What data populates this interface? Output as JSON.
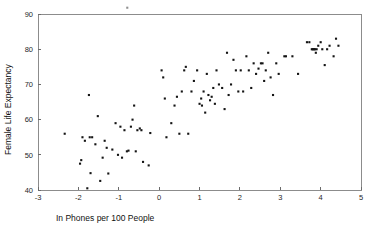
{
  "chart_data": {
    "type": "scatter",
    "title": "",
    "subtitle": "",
    "xlabel": "In Phones per 100 People",
    "ylabel": "Female Life Expectancy",
    "xlim": [
      -3,
      5
    ],
    "ylim": [
      40,
      90
    ],
    "xticks": [
      -3,
      -2,
      -1,
      0,
      1,
      2,
      3,
      4,
      5
    ],
    "xtick_labels": [
      "-3",
      "-2",
      "-1",
      "0",
      "1",
      "2",
      "3",
      "4",
      "5"
    ],
    "yticks": [
      40,
      50,
      60,
      70,
      80,
      90
    ],
    "ytick_labels": [
      "40",
      "50",
      "60",
      "70",
      "80",
      "90"
    ],
    "grid": false,
    "legend": null,
    "marker": "square-dot",
    "marker_color": "#141414",
    "frame_color": "#8c8c8c",
    "points": [
      [
        -2.34,
        56.0
      ],
      [
        -1.96,
        47.5
      ],
      [
        -1.93,
        48.5
      ],
      [
        -1.9,
        55.0
      ],
      [
        -1.84,
        54.0
      ],
      [
        -1.78,
        40.5
      ],
      [
        -1.74,
        67.0
      ],
      [
        -1.72,
        55.0
      ],
      [
        -1.7,
        44.8
      ],
      [
        -1.66,
        55.0
      ],
      [
        -1.58,
        53.0
      ],
      [
        -1.52,
        61.0
      ],
      [
        -1.46,
        42.6
      ],
      [
        -1.4,
        49.2
      ],
      [
        -1.35,
        54.0
      ],
      [
        -1.3,
        52.0
      ],
      [
        -1.26,
        44.7
      ],
      [
        -1.16,
        51.5
      ],
      [
        -1.08,
        59.0
      ],
      [
        -1.02,
        50.0
      ],
      [
        -0.96,
        58.0
      ],
      [
        -0.92,
        49.2
      ],
      [
        -0.86,
        57.0
      ],
      [
        -0.8,
        51.0
      ],
      [
        -0.76,
        51.2
      ],
      [
        -0.7,
        58.0
      ],
      [
        -0.66,
        60.0
      ],
      [
        -0.62,
        64.0
      ],
      [
        -0.58,
        51.0
      ],
      [
        -0.54,
        57.0
      ],
      [
        -0.48,
        57.5
      ],
      [
        -0.44,
        57.0
      ],
      [
        -0.4,
        48.0
      ],
      [
        -0.26,
        47.0
      ],
      [
        -0.22,
        56.2
      ],
      [
        0.06,
        74.0
      ],
      [
        0.1,
        72.0
      ],
      [
        0.14,
        66.0
      ],
      [
        0.18,
        55.0
      ],
      [
        0.3,
        59.0
      ],
      [
        0.38,
        64.0
      ],
      [
        0.44,
        66.5
      ],
      [
        0.5,
        56.0
      ],
      [
        0.56,
        68.0
      ],
      [
        0.62,
        74.0
      ],
      [
        0.66,
        75.0
      ],
      [
        0.72,
        56.0
      ],
      [
        0.8,
        68.0
      ],
      [
        0.86,
        71.0
      ],
      [
        0.94,
        74.0
      ],
      [
        1.0,
        64.5
      ],
      [
        1.04,
        66.0
      ],
      [
        1.06,
        64.0
      ],
      [
        1.1,
        68.0
      ],
      [
        1.14,
        62.0
      ],
      [
        1.18,
        73.0
      ],
      [
        1.22,
        67.0
      ],
      [
        1.26,
        65.5
      ],
      [
        1.3,
        66.5
      ],
      [
        1.34,
        69.0
      ],
      [
        1.38,
        64.5
      ],
      [
        1.42,
        74.0
      ],
      [
        1.48,
        70.0
      ],
      [
        1.56,
        69.0
      ],
      [
        1.62,
        63.0
      ],
      [
        1.68,
        79.0
      ],
      [
        1.72,
        67.0
      ],
      [
        1.78,
        70.0
      ],
      [
        1.84,
        77.0
      ],
      [
        1.9,
        74.0
      ],
      [
        1.96,
        68.0
      ],
      [
        2.02,
        74.0
      ],
      [
        2.08,
        68.0
      ],
      [
        2.16,
        78.0
      ],
      [
        2.22,
        74.0
      ],
      [
        2.28,
        69.0
      ],
      [
        2.34,
        76.0
      ],
      [
        2.4,
        73.0
      ],
      [
        2.46,
        74.5
      ],
      [
        2.52,
        76.0
      ],
      [
        2.56,
        76.0
      ],
      [
        2.6,
        71.0
      ],
      [
        2.64,
        74.0
      ],
      [
        2.7,
        79.0
      ],
      [
        2.76,
        72.0
      ],
      [
        2.82,
        67.0
      ],
      [
        2.9,
        76.0
      ],
      [
        2.96,
        73.0
      ],
      [
        3.1,
        78.0
      ],
      [
        3.14,
        78.0
      ],
      [
        3.3,
        78.0
      ],
      [
        3.44,
        73.0
      ],
      [
        3.66,
        82.0
      ],
      [
        3.72,
        82.0
      ],
      [
        3.78,
        80.0
      ],
      [
        3.8,
        80.0
      ],
      [
        3.82,
        80.0
      ],
      [
        3.84,
        80.0
      ],
      [
        3.86,
        80.0
      ],
      [
        3.88,
        79.0
      ],
      [
        3.9,
        80.0
      ],
      [
        3.94,
        81.0
      ],
      [
        4.0,
        82.0
      ],
      [
        4.04,
        80.0
      ],
      [
        4.1,
        75.5
      ],
      [
        4.16,
        80.0
      ],
      [
        4.22,
        81.0
      ],
      [
        4.32,
        78.0
      ],
      [
        4.38,
        83.0
      ],
      [
        4.44,
        81.0
      ]
    ],
    "stray_points": [
      [
        -0.79,
        91.8
      ]
    ]
  }
}
